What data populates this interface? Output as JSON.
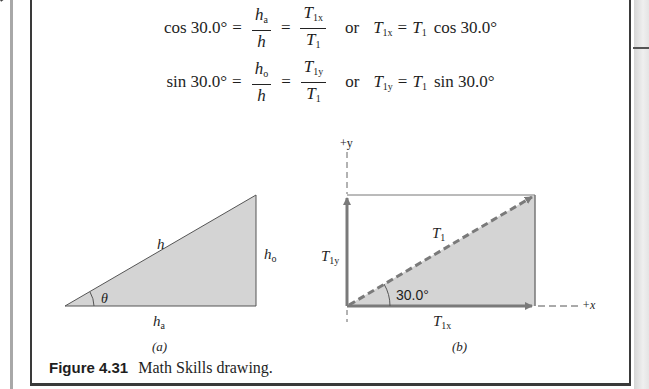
{
  "equations": {
    "row1": {
      "lhs": "cos 30.0°",
      "frac1": {
        "num_base": "h",
        "num_sub": "a",
        "den": "h"
      },
      "frac2": {
        "num_base": "T",
        "num_sub": "1x",
        "den_base": "T",
        "den_sub": "1"
      },
      "connector": "or",
      "rhs_left_base": "T",
      "rhs_left_sub": "1x",
      "rhs_right_base": "T",
      "rhs_right_sub": "1",
      "rhs_func": "cos 30.0°"
    },
    "row2": {
      "lhs": "sin 30.0°",
      "frac1": {
        "num_base": "h",
        "num_sub": "o",
        "den": "h"
      },
      "frac2": {
        "num_base": "T",
        "num_sub": "1y",
        "den_base": "T",
        "den_sub": "1"
      },
      "connector": "or",
      "rhs_left_base": "T",
      "rhs_left_sub": "1y",
      "rhs_right_base": "T",
      "rhs_right_sub": "1",
      "rhs_func": "sin 30.0°"
    },
    "equals": "="
  },
  "diagram_a": {
    "hypotenuse_label": "h",
    "opposite_label_base": "h",
    "opposite_label_sub": "o",
    "adjacent_label_base": "h",
    "adjacent_label_sub": "a",
    "angle_label": "θ",
    "sublabel": "(a)"
  },
  "diagram_b": {
    "y_axis_label": "+y",
    "x_axis_label": "+x",
    "vector_label_base": "T",
    "vector_label_sub": "1",
    "y_component_base": "T",
    "y_component_sub": "1y",
    "x_component_base": "T",
    "x_component_sub": "1x",
    "angle_label": "30.0°",
    "sublabel": "(b)"
  },
  "caption": {
    "figure_number": "Figure 4.31",
    "text": "Math Skills drawing."
  },
  "colors": {
    "shade": "#d4d4d4",
    "arrow": "#7a7a7a",
    "line": "#555555",
    "border": "#3a3a3a"
  }
}
